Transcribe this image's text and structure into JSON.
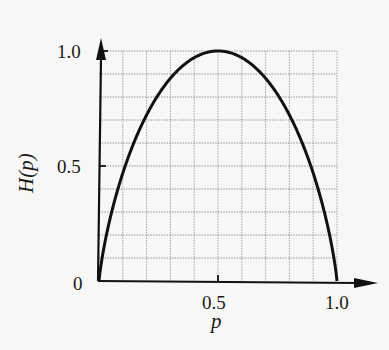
{
  "chart_data": {
    "type": "line",
    "title": "",
    "xlabel": "p",
    "ylabel": "H(p)",
    "xlim": [
      0,
      1.0
    ],
    "ylim": [
      0,
      1.0
    ],
    "grid": true,
    "grid_divisions": {
      "x": 10,
      "y": 10
    },
    "x_ticks": [
      {
        "value": 0.5,
        "label": "0.5"
      },
      {
        "value": 1.0,
        "label": "1.0"
      }
    ],
    "y_ticks": [
      {
        "value": 0,
        "label": "0"
      },
      {
        "value": 0.5,
        "label": "0.5"
      },
      {
        "value": 1.0,
        "label": "1.0"
      }
    ],
    "series": [
      {
        "name": "H(p)",
        "function": "binary entropy -p*log2(p)-(1-p)*log2(1-p)",
        "x": [
          0,
          0.05,
          0.1,
          0.15,
          0.2,
          0.25,
          0.3,
          0.35,
          0.4,
          0.45,
          0.5,
          0.55,
          0.6,
          0.65,
          0.7,
          0.75,
          0.8,
          0.85,
          0.9,
          0.95,
          1.0
        ],
        "values": [
          0,
          0.286,
          0.469,
          0.61,
          0.722,
          0.811,
          0.881,
          0.934,
          0.971,
          0.993,
          1.0,
          0.993,
          0.971,
          0.934,
          0.881,
          0.811,
          0.722,
          0.61,
          0.469,
          0.286,
          0
        ]
      }
    ],
    "legend": null
  },
  "labels": {
    "x_title": "p",
    "y_title": "H(p)",
    "y_tick_0": "0",
    "y_tick_05": "0.5",
    "y_tick_10": "1.0",
    "x_tick_05": "0.5",
    "x_tick_10": "1.0"
  }
}
